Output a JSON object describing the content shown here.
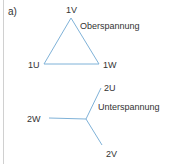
{
  "panel_label": "a)",
  "colors": {
    "line": "#7fb2d8",
    "text": "#333333",
    "rule": "#d0d0d0"
  },
  "triangle": {
    "caption": "Oberspannung",
    "vertices": {
      "top": "1V",
      "left": "1U",
      "right": "1W"
    }
  },
  "star": {
    "caption": "Unterspannung",
    "ends": {
      "upper_right": "2U",
      "left": "2W",
      "lower_right": "2V"
    }
  }
}
